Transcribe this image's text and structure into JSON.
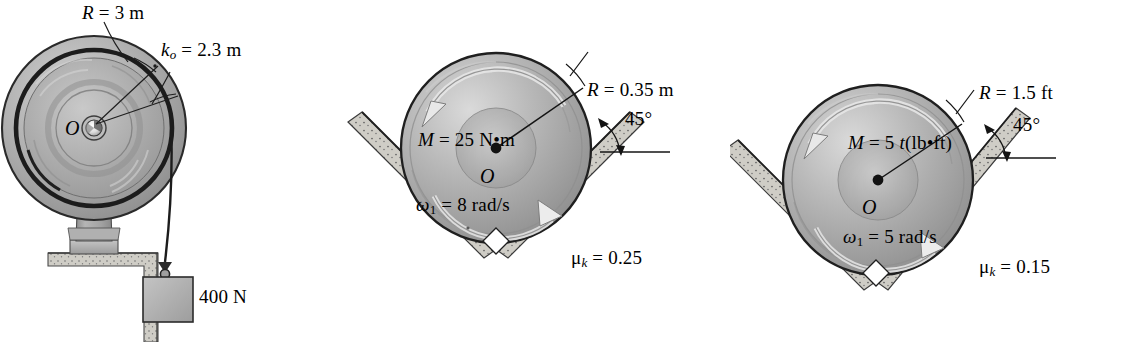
{
  "figure": {
    "kind": "engineering-mechanics-problem-figures",
    "panel_count": 3
  },
  "panels": [
    {
      "id": "winch-drum",
      "name": "winch-drum-on-pedestal-with-hanging-weight",
      "labels": {
        "radius": {
          "var": "R",
          "eq": "=",
          "value": "3",
          "unit": "m",
          "full": "R = 3 m"
        },
        "radius_of_gyration": {
          "var": "k",
          "subscript": "o",
          "eq": "=",
          "value": "2.3",
          "unit": "m",
          "full": "ko = 2.3 m"
        },
        "center": "O",
        "weight": "400 N"
      },
      "parts": {
        "drum": "large-grooved-drum",
        "hub": "hub-pin",
        "column": "vertical-support-column",
        "base_plate": "base-plate",
        "ground": "hatched-ground-step",
        "cable": "cable",
        "hook": "hook",
        "block": "suspended-block"
      }
    },
    {
      "id": "wheel-v-groove-si",
      "name": "wheel-in-45-degree-v-groove-si-units",
      "labels": {
        "radius": {
          "var": "R",
          "eq": "=",
          "value": "0.35",
          "unit": "m",
          "full": "R = 0.35 m"
        },
        "moment": {
          "var": "M",
          "eq": "=",
          "value": "25",
          "unit": "N•m",
          "full": "M = 25 N•m"
        },
        "center": "O",
        "angular_velocity": {
          "var": "ω",
          "subscript": "1",
          "eq": "=",
          "value": "8",
          "unit": "rad/s",
          "full": "ω1 = 8 rad/s"
        },
        "friction": {
          "var": "μ",
          "subscript": "k",
          "eq": "=",
          "value": "0.25",
          "full": "μk = 0.25"
        },
        "incline_angle": "45°"
      },
      "parts": {
        "wheel": "disk-wheel",
        "groove_left": "left-incline-surface",
        "groove_right": "right-incline-surface",
        "right_angle_marker": "right-angle-marker-diamond",
        "moment_arrow": "ccw-moment-arrow",
        "omega_arrow": "cw-spin-arrow",
        "radius_leader": "radius-line",
        "angle_arc": "angle-arc",
        "horizontal_datum": "horizontal-reference-line"
      }
    },
    {
      "id": "wheel-v-groove-fps",
      "name": "wheel-in-45-degree-v-groove-fps-units",
      "labels": {
        "radius": {
          "var": "R",
          "eq": "=",
          "value": "1.5",
          "unit": "ft",
          "full": "R = 1.5 ft"
        },
        "moment": {
          "var": "M",
          "eq": "=",
          "value": "5",
          "time_var": "t",
          "unit": "(lb•ft)",
          "full": "M = 5 t(lb•ft)"
        },
        "center": "O",
        "angular_velocity": {
          "var": "ω",
          "subscript": "1",
          "eq": "=",
          "value": "5",
          "unit": "rad/s",
          "full": "ω1 = 5 rad/s"
        },
        "friction": {
          "var": "μ",
          "subscript": "k",
          "eq": "=",
          "value": "0.15",
          "full": "μk = 0.15"
        },
        "incline_angle": "45°"
      },
      "parts": {
        "wheel": "disk-wheel",
        "groove_left": "left-incline-surface",
        "groove_right": "right-incline-surface",
        "right_angle_marker": "right-angle-marker-diamond",
        "moment_arrow": "ccw-moment-arrow",
        "omega_arrow": "cw-spin-arrow",
        "radius_leader": "radius-line",
        "angle_arc": "angle-arc",
        "horizontal_datum": "horizontal-reference-line"
      }
    }
  ],
  "colors": {
    "ink": "#1a1a1a",
    "metal_light": "#d8d8d8",
    "metal_mid": "#a8a8a8",
    "metal_dark": "#7d7d7d",
    "hatch_fill": "#cfcdc6",
    "background": "#ffffff"
  }
}
